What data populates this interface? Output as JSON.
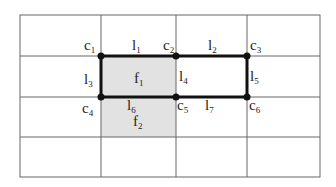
{
  "diagram": {
    "grid": {
      "cols_x": [
        20,
        101,
        176,
        247,
        320
      ],
      "rows_y": [
        15,
        56,
        97,
        137,
        177
      ],
      "line_color": "#666666",
      "shade_color": "#e2e2e2"
    },
    "faces": [
      {
        "id": "f1",
        "base": "f",
        "sub": "1"
      },
      {
        "id": "f2",
        "base": "f",
        "sub": "2"
      }
    ],
    "corners": [
      {
        "id": "c1",
        "base": "c",
        "sub": "1"
      },
      {
        "id": "c2",
        "base": "c",
        "sub": "2"
      },
      {
        "id": "c3",
        "base": "c",
        "sub": "3"
      },
      {
        "id": "c4",
        "base": "c",
        "sub": "4"
      },
      {
        "id": "c5",
        "base": "c",
        "sub": "5"
      },
      {
        "id": "c6",
        "base": "c",
        "sub": "6"
      }
    ],
    "lines": [
      {
        "id": "l1",
        "base": "l",
        "sub": "1"
      },
      {
        "id": "l2",
        "base": "l",
        "sub": "2"
      },
      {
        "id": "l3",
        "base": "l",
        "sub": "3"
      },
      {
        "id": "l4",
        "base": "l",
        "sub": "4"
      },
      {
        "id": "l5",
        "base": "l",
        "sub": "5"
      },
      {
        "id": "l6",
        "base": "l",
        "sub": "6"
      },
      {
        "id": "l7",
        "base": "l",
        "sub": "7"
      }
    ]
  }
}
